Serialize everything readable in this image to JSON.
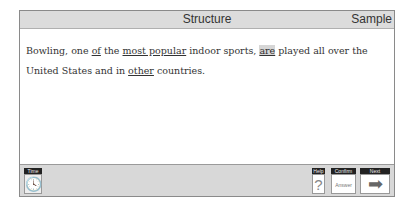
{
  "header": {
    "title": "Structure",
    "section": "Sample"
  },
  "question": {
    "segments": [
      {
        "text": "Bowling, one ",
        "style": "plain"
      },
      {
        "text": "of",
        "style": "underline"
      },
      {
        "text": " the ",
        "style": "plain"
      },
      {
        "text": "most popular",
        "style": "underline"
      },
      {
        "text": " indoor sports, ",
        "style": "plain"
      },
      {
        "text": "are",
        "style": "highlight"
      },
      {
        "text": " played all over the United States and in ",
        "style": "plain"
      },
      {
        "text": "other",
        "style": "underline"
      },
      {
        "text": " countries.",
        "style": "plain"
      }
    ]
  },
  "toolbar": {
    "time": {
      "label": "Time",
      "icon": "clock-icon",
      "glyph": "🕓"
    },
    "help": {
      "label": "Help",
      "icon": "question-icon",
      "glyph": "?"
    },
    "confirm": {
      "label": "Confirm",
      "text": "Answer"
    },
    "next": {
      "label": "Next",
      "icon": "arrow-right-icon",
      "glyph": "➡"
    }
  },
  "colors": {
    "header_bg": "#dcdcdc",
    "toolbar_bg": "#d8d8d8",
    "highlight": "#d6d6d6"
  }
}
